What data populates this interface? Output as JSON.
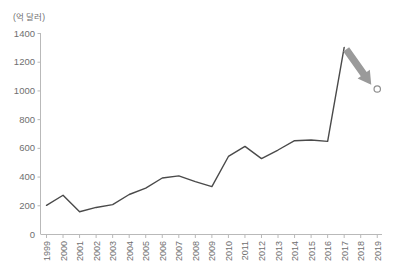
{
  "chart_data": {
    "type": "line",
    "title": "",
    "subtitle": "",
    "xlabel": "",
    "ylabel": "",
    "unit_label": "(억 달러)",
    "grid": false,
    "legend": false,
    "xlim": [
      "1999",
      "2019"
    ],
    "ylim": [
      0,
      1400
    ],
    "ytick_labels": [
      "0",
      "200",
      "400",
      "600",
      "800",
      "1000",
      "1200",
      "1400"
    ],
    "ytick_values": [
      0,
      200,
      400,
      600,
      800,
      1000,
      1200,
      1400
    ],
    "categories": [
      "1999",
      "2000",
      "2001",
      "2002",
      "2003",
      "2004",
      "2005",
      "2006",
      "2007",
      "2008",
      "2009",
      "2010",
      "2011",
      "2012",
      "2013",
      "2014",
      "2015",
      "2016",
      "2017",
      "2018",
      "2019"
    ],
    "series": [
      {
        "name": "actual",
        "values": [
          200,
          270,
          155,
          185,
          205,
          275,
          320,
          390,
          405,
          365,
          330,
          540,
          610,
          525,
          585,
          650,
          655,
          645,
          1300,
          null,
          null
        ],
        "style": "solid-line",
        "color": "#4a4a4a"
      },
      {
        "name": "forecast-point",
        "values": [
          null,
          null,
          null,
          null,
          null,
          null,
          null,
          null,
          null,
          null,
          null,
          null,
          null,
          null,
          null,
          null,
          null,
          null,
          null,
          null,
          1010
        ],
        "style": "hollow-circle-marker",
        "color": "#8e8e8e"
      }
    ],
    "annotations": [
      {
        "name": "decline-arrow",
        "type": "arrow",
        "color": "#9a9a9a",
        "from": {
          "x": "2017",
          "y": 1300
        },
        "to": {
          "x": "2019",
          "y": 1040
        }
      }
    ]
  },
  "axes": {
    "y_axis_name": "y-axis",
    "x_axis_name": "x-axis"
  }
}
